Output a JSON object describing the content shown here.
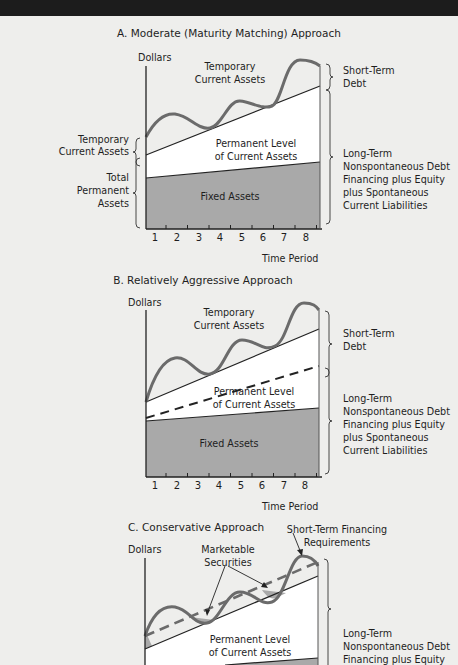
{
  "figure": {
    "colors": {
      "fixed_assets_fill": "#a9a9a9",
      "permanent_fill": "#ffffff",
      "wave_stroke": "#6b6b6b",
      "marketable_securities_fill": "#a9a9a9",
      "background": "#eeeeec"
    },
    "panels": [
      {
        "id": "A",
        "title": "A. Moderate (Maturity Matching) Approach",
        "y_axis_label": "Dollars",
        "x_axis_label": "Time Period",
        "ticks": [
          "1",
          "2",
          "3",
          "4",
          "5",
          "6",
          "7",
          "8"
        ],
        "region_labels": {
          "temporary": [
            "Temporary",
            "Current Assets"
          ],
          "permanent": [
            "Permanent Level",
            "of Current Assets"
          ],
          "fixed": "Fixed Assets"
        },
        "left_labels": {
          "temporary": [
            "Temporary",
            "Current Assets"
          ],
          "total_permanent": [
            "Total",
            "Permanent",
            "Assets"
          ]
        },
        "right_labels": {
          "short_term": [
            "Short-Term",
            "Debt"
          ],
          "long_term": [
            "Long-Term",
            "Nonspontaneous Debt",
            "Financing plus Equity",
            "plus Spontaneous",
            "Current Liabilities"
          ]
        }
      },
      {
        "id": "B",
        "title": "B. Relatively Aggressive Approach",
        "y_axis_label": "Dollars",
        "x_axis_label": "Time Period",
        "ticks": [
          "1",
          "2",
          "3",
          "4",
          "5",
          "6",
          "7",
          "8"
        ],
        "region_labels": {
          "temporary": [
            "Temporary",
            "Current Assets"
          ],
          "permanent": [
            "Permanent Level",
            "of Current Assets"
          ],
          "fixed": "Fixed Assets"
        },
        "right_labels": {
          "short_term": [
            "Short-Term",
            "Debt"
          ],
          "long_term": [
            "Long-Term",
            "Nonspontaneous Debt",
            "Financing plus Equity",
            "plus Spontaneous",
            "Current Liabilities"
          ]
        }
      },
      {
        "id": "C",
        "title": "C. Conservative Approach",
        "y_axis_label": "Dollars",
        "region_labels": {
          "marketable": [
            "Marketable",
            "Securities"
          ],
          "short_term_req": [
            "Short-Term Financing",
            "Requirements"
          ],
          "permanent": [
            "Permanent Level",
            "of Current Assets"
          ]
        },
        "right_labels": {
          "long_term": [
            "Long-Term",
            "Nonspontaneous Debt",
            "Financing plus Equity"
          ]
        }
      }
    ]
  }
}
